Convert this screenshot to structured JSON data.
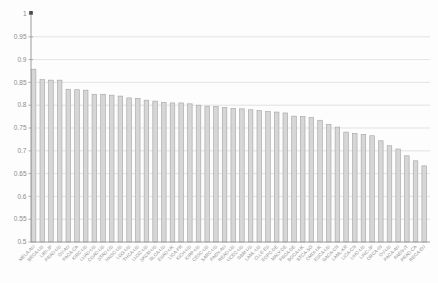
{
  "chart_data": {
    "type": "bar",
    "title": "",
    "xlabel": "",
    "ylabel": "",
    "categories": [
      "MELA-AU",
      "BRCA-US",
      "LIRI-JP",
      "PRAD-US",
      "OV-AU",
      "PACA-CA",
      "KIRC-US",
      "LUAD-US",
      "COAD-US",
      "STAD-US",
      "HNSC-US",
      "LGG-US",
      "THCA-US",
      "LUSC-US",
      "SKCM-US",
      "BLCA-US",
      "ESAD-UK",
      "LICA-FR",
      "KICH-US",
      "KIRP-US",
      "CESC-US",
      "SARC-US",
      "PAEN-AU",
      "READ-US",
      "UCEC-US",
      "GBM-US",
      "LAML-US",
      "CLLE-ES",
      "EOPC-DE",
      "MALY-DE",
      "PBCA-DE",
      "BOCA-UK",
      "BTCA-SG",
      "CMDI-UK",
      "ESCA-US",
      "GACA-CN",
      "LAML-KR",
      "LICA-CN",
      "LIHC-US",
      "LINC-JP",
      "ORCA-IN",
      "OV-US",
      "PACA-AU",
      "PAEN-IT",
      "PRAD-CA",
      "RECA-EU"
    ],
    "values": [
      0.879,
      0.856,
      0.855,
      0.855,
      0.835,
      0.834,
      0.833,
      0.824,
      0.824,
      0.822,
      0.82,
      0.816,
      0.815,
      0.811,
      0.809,
      0.806,
      0.805,
      0.805,
      0.803,
      0.8,
      0.798,
      0.797,
      0.795,
      0.793,
      0.792,
      0.79,
      0.788,
      0.786,
      0.785,
      0.783,
      0.776,
      0.775,
      0.773,
      0.767,
      0.758,
      0.752,
      0.741,
      0.738,
      0.736,
      0.733,
      0.722,
      0.711,
      0.704,
      0.689,
      0.678,
      0.667
    ],
    "ylim": [
      0.5,
      1.0
    ],
    "ytick_step": 0.05,
    "ytick_labels": [
      "1",
      "0.95",
      "0.9",
      "0.85",
      "0.8",
      "0.75",
      "0.7",
      "0.65",
      "0.6",
      "0.55",
      "0.5"
    ],
    "grid": true,
    "legend_position": "none",
    "axis_top_marker": true,
    "colors": {
      "bar_fill": "#d6d6d6",
      "bar_border": "#a3a3a3",
      "gridline": "#dcdcdc",
      "axis": "#9b9b9b",
      "tick_label": "#8c8c8c",
      "marker": "#4a4a4a",
      "background": "#fdfdfd"
    }
  }
}
